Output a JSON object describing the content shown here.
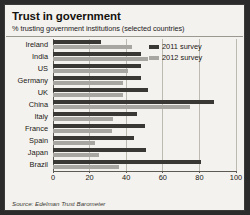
{
  "title": "Trust in government",
  "subtitle": "% trusting government institutions (selected countries)",
  "source": "Source: Edelman Trust Barometer",
  "legend": {
    "items": [
      {
        "label": "2011 survey",
        "color": "#3a3834"
      },
      {
        "label": "2012 survey",
        "color": "#a8a6a0"
      }
    ]
  },
  "axis": {
    "ticks": [
      "0",
      "20",
      "40",
      "60",
      "80",
      "100"
    ]
  },
  "chart_data": {
    "type": "bar",
    "orientation": "horizontal",
    "title": "Trust in government",
    "subtitle": "% trusting government institutions (selected countries)",
    "xlabel": "",
    "ylabel": "",
    "xlim": [
      0,
      100
    ],
    "ticks": [
      0,
      20,
      40,
      60,
      80,
      100
    ],
    "grid": true,
    "legend_position": "top-right",
    "source": "Source: Edelman Trust Barometer",
    "categories": [
      "Ireland",
      "India",
      "US",
      "Germany",
      "UK",
      "China",
      "Italy",
      "France",
      "Spain",
      "Japan",
      "Brazil"
    ],
    "series": [
      {
        "name": "2011 survey",
        "color": "#3a3834",
        "values": [
          26,
          48,
          48,
          48,
          52,
          88,
          46,
          50,
          44,
          51,
          81
        ]
      },
      {
        "name": "2012 survey",
        "color": "#a8a6a0",
        "values": [
          43,
          52,
          41,
          38,
          38,
          75,
          33,
          32,
          23,
          25,
          36
        ]
      }
    ]
  }
}
